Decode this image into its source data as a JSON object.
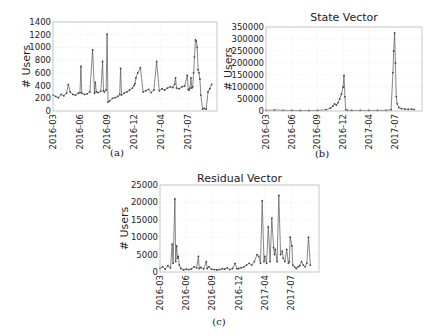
{
  "chart_data": [
    {
      "id": "a",
      "type": "line",
      "title": "",
      "caption": "(a)",
      "xlabel": "",
      "ylabel": "# Users",
      "ylim": [
        0,
        1400
      ],
      "yticks": [
        0,
        200,
        400,
        600,
        800,
        1000,
        1200,
        1400
      ],
      "ytick_labels": [
        "0",
        "200",
        "400",
        "600",
        "800",
        "1000",
        "1200",
        "1400"
      ],
      "xlim": [
        0,
        18.2
      ],
      "xticks": [
        0,
        3,
        6,
        9,
        12,
        15
      ],
      "xtick_labels": [
        "2016-03",
        "2016-06",
        "2016-09",
        "2016-12",
        "2017-04",
        "2017-07"
      ],
      "grid": true,
      "series": [
        {
          "name": "users",
          "x": [
            0,
            0.3,
            0.6,
            0.9,
            1.2,
            1.5,
            1.7,
            1.9,
            2.2,
            2.5,
            2.8,
            3.0,
            3.1,
            3.2,
            3.5,
            3.8,
            4.1,
            4.4,
            4.6,
            4.7,
            4.8,
            5.0,
            5.3,
            5.5,
            5.6,
            5.7,
            5.9,
            6.0,
            6.1,
            6.3,
            6.6,
            6.9,
            7.2,
            7.4,
            7.5,
            7.6,
            7.9,
            8.2,
            8.5,
            8.8,
            9.0,
            9.1,
            9.2,
            9.4,
            9.7,
            10.0,
            10.3,
            10.6,
            10.9,
            11.2,
            11.5,
            11.8,
            12.1,
            12.4,
            12.7,
            13.0,
            13.3,
            13.5,
            13.6,
            13.7,
            14.0,
            14.3,
            14.6,
            14.9,
            15.0,
            15.1,
            15.2,
            15.3,
            15.4,
            15.5,
            15.6,
            15.7,
            15.8,
            15.9,
            16.0,
            16.1,
            16.2,
            16.3,
            16.4,
            16.6,
            16.8,
            17.0,
            17.2,
            17.4,
            17.6
          ],
          "y": [
            250,
            230,
            210,
            260,
            240,
            280,
            420,
            300,
            260,
            250,
            280,
            290,
            700,
            280,
            260,
            270,
            300,
            960,
            280,
            450,
            300,
            290,
            310,
            780,
            320,
            300,
            330,
            1210,
            140,
            160,
            200,
            210,
            230,
            260,
            670,
            250,
            280,
            300,
            330,
            360,
            400,
            430,
            520,
            600,
            680,
            300,
            320,
            340,
            290,
            330,
            780,
            320,
            350,
            330,
            360,
            380,
            370,
            420,
            520,
            360,
            350,
            380,
            390,
            560,
            340,
            330,
            360,
            520,
            360,
            380,
            600,
            850,
            1120,
            1100,
            1000,
            650,
            600,
            500,
            250,
            30,
            40,
            30,
            300,
            350,
            420
          ]
        }
      ]
    },
    {
      "id": "b",
      "type": "line",
      "title": "State Vector",
      "caption": "(b)",
      "xlabel": "",
      "ylabel": "# Users",
      "ylim": [
        0,
        350000
      ],
      "yticks": [
        0,
        50000,
        100000,
        150000,
        200000,
        250000,
        300000,
        350000
      ],
      "ytick_labels": [
        "0",
        "50000",
        "100000",
        "150000",
        "200000",
        "250000",
        "300000",
        "350000"
      ],
      "xlim": [
        0,
        18.2
      ],
      "xticks": [
        0,
        3,
        6,
        9,
        12,
        15
      ],
      "xtick_labels": [
        "2016-03",
        "2016-06",
        "2016-09",
        "2016-12",
        "2017-04",
        "2017-07"
      ],
      "grid": true,
      "series": [
        {
          "name": "state",
          "x": [
            0,
            1,
            2,
            3,
            4,
            5,
            6,
            7,
            7.5,
            7.8,
            8.0,
            8.2,
            8.4,
            8.6,
            8.8,
            9.0,
            9.1,
            9.2,
            9.3,
            9.5,
            10,
            11,
            12,
            13,
            14,
            14.6,
            14.8,
            14.9,
            15.0,
            15.1,
            15.2,
            15.3,
            15.5,
            15.8,
            16.2,
            16.6,
            17.0,
            17.3
          ],
          "y": [
            3000,
            4000,
            3000,
            2500,
            2000,
            2000,
            2500,
            5000,
            12000,
            20000,
            30000,
            25000,
            35000,
            50000,
            70000,
            100000,
            148000,
            60000,
            5000,
            3000,
            2500,
            2500,
            2500,
            2500,
            3000,
            5000,
            160000,
            250000,
            325000,
            200000,
            60000,
            30000,
            15000,
            10000,
            8000,
            7000,
            8000,
            6000
          ]
        }
      ]
    },
    {
      "id": "c",
      "type": "line",
      "title": "Residual Vector",
      "caption": "(c)",
      "xlabel": "",
      "ylabel": "# Users",
      "ylim": [
        0,
        25000
      ],
      "yticks": [
        0,
        5000,
        10000,
        15000,
        20000,
        25000
      ],
      "ytick_labels": [
        "0",
        "5000",
        "10000",
        "15000",
        "20000",
        "25000"
      ],
      "xlim": [
        0,
        18.2
      ],
      "xticks": [
        0,
        3,
        6,
        9,
        12,
        15
      ],
      "xtick_labels": [
        "2016-03",
        "2016-06",
        "2016-09",
        "2016-12",
        "2017-04",
        "2017-07"
      ],
      "grid": true,
      "series": [
        {
          "name": "residual",
          "x": [
            0,
            0.3,
            0.6,
            0.9,
            1.2,
            1.4,
            1.5,
            1.7,
            1.8,
            1.9,
            2.0,
            2.1,
            2.2,
            2.4,
            2.7,
            3.0,
            3.3,
            3.6,
            3.9,
            4.2,
            4.4,
            4.5,
            4.7,
            5.0,
            5.3,
            5.4,
            5.6,
            5.9,
            6.2,
            6.5,
            6.8,
            7.1,
            7.4,
            7.7,
            8.0,
            8.3,
            8.6,
            8.8,
            9.0,
            9.3,
            9.6,
            9.9,
            10.2,
            10.5,
            10.8,
            11.1,
            11.3,
            11.5,
            11.7,
            11.9,
            12.0,
            12.2,
            12.4,
            12.6,
            12.8,
            13.0,
            13.1,
            13.2,
            13.4,
            13.6,
            13.8,
            14.0,
            14.1,
            14.3,
            14.5,
            14.7,
            14.8,
            14.9,
            15.1,
            15.2,
            15.4,
            15.6,
            15.8,
            16.0,
            16.2,
            16.4,
            16.6,
            16.8,
            17.0,
            17.2
          ],
          "y": [
            1000,
            1500,
            800,
            1800,
            1200,
            8000,
            2500,
            21000,
            3000,
            7500,
            4000,
            4500,
            2000,
            1000,
            600,
            800,
            700,
            900,
            1500,
            1200,
            4500,
            1000,
            1300,
            900,
            3000,
            1000,
            1500,
            800,
            700,
            600,
            700,
            900,
            800,
            1200,
            700,
            1000,
            2500,
            900,
            1000,
            1200,
            1500,
            2000,
            2500,
            2000,
            3000,
            5000,
            4500,
            2500,
            20500,
            3000,
            4500,
            2500,
            13000,
            3000,
            15500,
            7000,
            5000,
            6500,
            3000,
            22000,
            5000,
            6000,
            4000,
            3000,
            6500,
            2500,
            3000,
            10000,
            7500,
            2000,
            1500,
            1000,
            1500,
            1800,
            3000,
            2000,
            1500,
            2500,
            10000,
            2000
          ]
        }
      ]
    }
  ]
}
